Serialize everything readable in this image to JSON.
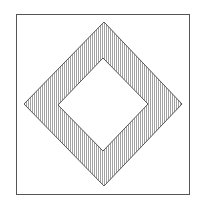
{
  "figure": {
    "width": 199,
    "height": 211,
    "background": "#ffffff",
    "stroke_color": "#555555",
    "hatch_color": "#8a8a8a",
    "hatch_spacing": 2,
    "outer_square": {
      "x": 16,
      "y": 14,
      "w": 173,
      "h": 180
    },
    "outer_diamond": {
      "top": [
        104,
        22
      ],
      "right": [
        182,
        104
      ],
      "bottom": [
        104,
        186
      ],
      "left": [
        24,
        104
      ]
    },
    "inner_diamond": {
      "top": [
        103,
        58
      ],
      "right": [
        148,
        104
      ],
      "bottom": [
        103,
        151
      ],
      "left": [
        58,
        105
      ]
    },
    "fill_pattern": "vertical-hatch"
  }
}
